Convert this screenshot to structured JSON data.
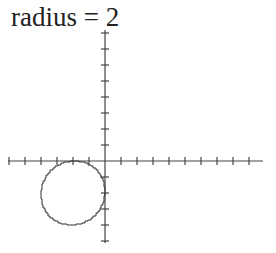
{
  "title": "radius = 2",
  "colors": {
    "axis": "#444444",
    "circle": "#333333",
    "text": "#222222",
    "background": "#ffffff"
  },
  "chart_data": {
    "type": "diagram",
    "title": "radius = 2",
    "axes": {
      "x_range_ticks": [
        -6,
        10
      ],
      "y_range_ticks": [
        -5,
        8
      ],
      "tick_spacing_units": 1,
      "grid": false
    },
    "shape": {
      "kind": "circle",
      "center": [
        -2,
        -2
      ],
      "radius": 2,
      "rendering": "pixelated outline"
    }
  }
}
